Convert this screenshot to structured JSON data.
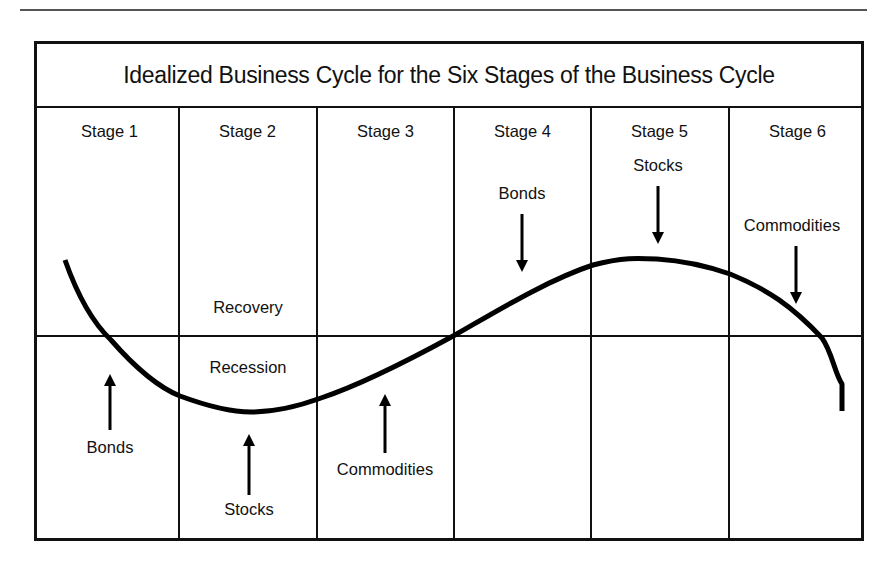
{
  "title": "Idealized Business Cycle for the Six Stages of the Business Cycle",
  "stages": [
    {
      "label": "Stage 1"
    },
    {
      "label": "Stage 2"
    },
    {
      "label": "Stage 3"
    },
    {
      "label": "Stage 4"
    },
    {
      "label": "Stage 5"
    },
    {
      "label": "Stage 6"
    }
  ],
  "zones": {
    "above": "Recovery",
    "below": "Recession"
  },
  "annotations": [
    {
      "text": "Bonds",
      "stage": 1,
      "arrow": "up"
    },
    {
      "text": "Stocks",
      "stage": 2,
      "arrow": "up"
    },
    {
      "text": "Commodities",
      "stage": 3,
      "arrow": "up"
    },
    {
      "text": "Bonds",
      "stage": 4,
      "arrow": "down"
    },
    {
      "text": "Stocks",
      "stage": 5,
      "arrow": "down"
    },
    {
      "text": "Commodities",
      "stage": 6,
      "arrow": "down"
    }
  ],
  "curve": {
    "description": "Sine-like business cycle curve: falls through Stage 1, trough in Stage 2, rises through Stages 3-4, peak in Stage 5, falls in Stage 6",
    "color": "#000000"
  }
}
